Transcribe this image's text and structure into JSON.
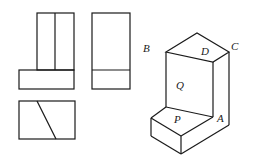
{
  "figure": {
    "views": {
      "front_view": "front",
      "side_view": "side",
      "top_view": "top"
    },
    "isometric": {
      "labels": {
        "B": "B",
        "C": "C",
        "D": "D",
        "Q": "Q",
        "P": "P",
        "A": "A"
      }
    },
    "colors": {
      "stroke": "#1a1a1a",
      "background": "#ffffff"
    }
  }
}
